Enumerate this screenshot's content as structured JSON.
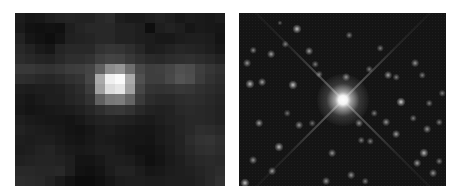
{
  "figure": {
    "panels": [
      {
        "id": "left",
        "description": "Low-resolution pixelated image of a single point source",
        "grid": {
          "cols": 21,
          "rows": 17,
          "values": [
            [
              28,
              22,
              24,
              30,
              34,
              36,
              34,
              34,
              40,
              44,
              30,
              26,
              26,
              30,
              34,
              30,
              24,
              28,
              26,
              24,
              28
            ],
            [
              26,
              18,
              16,
              18,
              16,
              30,
              36,
              40,
              40,
              40,
              34,
              34,
              30,
              14,
              30,
              34,
              30,
              22,
              26,
              24,
              22
            ],
            [
              34,
              22,
              18,
              14,
              20,
              32,
              34,
              36,
              40,
              40,
              34,
              34,
              30,
              28,
              24,
              24,
              28,
              30,
              30,
              28,
              20
            ],
            [
              40,
              34,
              26,
              22,
              36,
              40,
              40,
              40,
              50,
              54,
              52,
              46,
              38,
              28,
              30,
              34,
              38,
              36,
              34,
              30,
              24
            ],
            [
              44,
              40,
              36,
              34,
              40,
              46,
              46,
              50,
              62,
              68,
              66,
              56,
              48,
              42,
              40,
              44,
              46,
              48,
              44,
              40,
              34
            ],
            [
              56,
              56,
              52,
              50,
              54,
              60,
              62,
              68,
              96,
              140,
              150,
              110,
              72,
              62,
              64,
              70,
              80,
              76,
              62,
              54,
              48
            ],
            [
              46,
              44,
              40,
              38,
              42,
              48,
              52,
              70,
              170,
              240,
              250,
              170,
              80,
              62,
              62,
              72,
              84,
              78,
              60,
              50,
              44
            ],
            [
              30,
              28,
              30,
              30,
              32,
              38,
              44,
              60,
              160,
              220,
              230,
              160,
              70,
              52,
              50,
              52,
              56,
              54,
              48,
              44,
              40
            ],
            [
              26,
              22,
              26,
              30,
              30,
              36,
              40,
              50,
              96,
              120,
              124,
              100,
              58,
              44,
              40,
              40,
              44,
              46,
              44,
              40,
              36
            ],
            [
              24,
              20,
              22,
              24,
              26,
              28,
              32,
              38,
              46,
              54,
              56,
              50,
              40,
              34,
              32,
              34,
              40,
              42,
              40,
              38,
              34
            ],
            [
              30,
              26,
              24,
              22,
              22,
              20,
              24,
              30,
              34,
              36,
              34,
              32,
              28,
              26,
              30,
              34,
              36,
              40,
              40,
              38,
              34
            ],
            [
              34,
              30,
              28,
              26,
              24,
              20,
              18,
              22,
              28,
              30,
              26,
              24,
              22,
              22,
              26,
              30,
              36,
              40,
              46,
              44,
              40
            ],
            [
              30,
              28,
              30,
              30,
              26,
              22,
              20,
              24,
              28,
              26,
              24,
              22,
              22,
              20,
              26,
              30,
              34,
              44,
              50,
              52,
              46
            ],
            [
              28,
              30,
              34,
              36,
              30,
              26,
              24,
              26,
              30,
              30,
              26,
              22,
              18,
              18,
              22,
              28,
              34,
              40,
              46,
              48,
              44
            ],
            [
              32,
              34,
              36,
              36,
              34,
              30,
              20,
              20,
              24,
              30,
              30,
              28,
              22,
              16,
              20,
              26,
              30,
              36,
              40,
              42,
              40
            ],
            [
              40,
              40,
              38,
              38,
              40,
              30,
              18,
              16,
              20,
              28,
              34,
              34,
              28,
              22,
              24,
              28,
              30,
              32,
              36,
              40,
              44
            ],
            [
              44,
              42,
              40,
              34,
              26,
              18,
              12,
              12,
              16,
              22,
              28,
              30,
              30,
              28,
              28,
              30,
              30,
              30,
              34,
              40,
              48
            ]
          ]
        }
      },
      {
        "id": "right",
        "description": "High-resolution star field with a bright central star showing diffraction spikes",
        "central_star": {
          "x": 104,
          "y": 87,
          "core_radius": 6,
          "halo_radius": 26
        },
        "spikes": [
          {
            "angle": -45,
            "length": 150
          },
          {
            "angle": 135,
            "length": 150
          },
          {
            "angle": 45,
            "length": 150
          },
          {
            "angle": -135,
            "length": 150
          }
        ],
        "stars": [
          {
            "x": 58,
            "y": 16,
            "r": 3.5,
            "b": 0.75
          },
          {
            "x": 46,
            "y": 31,
            "r": 2.5,
            "b": 0.45
          },
          {
            "x": 14,
            "y": 37,
            "r": 2.5,
            "b": 0.5
          },
          {
            "x": 32,
            "y": 41,
            "r": 3,
            "b": 0.6
          },
          {
            "x": 70,
            "y": 38,
            "r": 3,
            "b": 0.6
          },
          {
            "x": 8,
            "y": 50,
            "r": 3,
            "b": 0.55
          },
          {
            "x": 11,
            "y": 71,
            "r": 3.5,
            "b": 0.7
          },
          {
            "x": 23,
            "y": 69,
            "r": 3,
            "b": 0.6
          },
          {
            "x": 54,
            "y": 72,
            "r": 3.5,
            "b": 0.75
          },
          {
            "x": 76,
            "y": 51,
            "r": 2.5,
            "b": 0.45
          },
          {
            "x": 41,
            "y": 10,
            "r": 2,
            "b": 0.35
          },
          {
            "x": 80,
            "y": 61,
            "r": 2.5,
            "b": 0.45
          },
          {
            "x": 141,
            "y": 35,
            "r": 2.5,
            "b": 0.45
          },
          {
            "x": 110,
            "y": 22,
            "r": 2.5,
            "b": 0.45
          },
          {
            "x": 107,
            "y": 64,
            "r": 3,
            "b": 0.55
          },
          {
            "x": 149,
            "y": 62,
            "r": 3,
            "b": 0.6
          },
          {
            "x": 130,
            "y": 56,
            "r": 2.5,
            "b": 0.45
          },
          {
            "x": 157,
            "y": 64,
            "r": 2.5,
            "b": 0.45
          },
          {
            "x": 176,
            "y": 50,
            "r": 3,
            "b": 0.55
          },
          {
            "x": 162,
            "y": 89,
            "r": 3.5,
            "b": 0.8
          },
          {
            "x": 183,
            "y": 62,
            "r": 2.5,
            "b": 0.45
          },
          {
            "x": 203,
            "y": 80,
            "r": 2.5,
            "b": 0.45
          },
          {
            "x": 190,
            "y": 90,
            "r": 2.5,
            "b": 0.45
          },
          {
            "x": 120,
            "y": 110,
            "r": 3,
            "b": 0.55
          },
          {
            "x": 135,
            "y": 100,
            "r": 2.5,
            "b": 0.45
          },
          {
            "x": 147,
            "y": 109,
            "r": 3,
            "b": 0.55
          },
          {
            "x": 157,
            "y": 121,
            "r": 3,
            "b": 0.6
          },
          {
            "x": 174,
            "y": 105,
            "r": 2.5,
            "b": 0.45
          },
          {
            "x": 200,
            "y": 109,
            "r": 2.5,
            "b": 0.45
          },
          {
            "x": 188,
            "y": 116,
            "r": 3,
            "b": 0.55
          },
          {
            "x": 122,
            "y": 127,
            "r": 2.5,
            "b": 0.45
          },
          {
            "x": 131,
            "y": 128,
            "r": 2.5,
            "b": 0.45
          },
          {
            "x": 185,
            "y": 140,
            "r": 3.5,
            "b": 0.7
          },
          {
            "x": 178,
            "y": 150,
            "r": 3,
            "b": 0.6
          },
          {
            "x": 200,
            "y": 148,
            "r": 2.5,
            "b": 0.45
          },
          {
            "x": 194,
            "y": 160,
            "r": 3,
            "b": 0.55
          },
          {
            "x": 112,
            "y": 162,
            "r": 3,
            "b": 0.55
          },
          {
            "x": 126,
            "y": 168,
            "r": 2.5,
            "b": 0.45
          },
          {
            "x": 93,
            "y": 140,
            "r": 3,
            "b": 0.55
          },
          {
            "x": 60,
            "y": 112,
            "r": 3,
            "b": 0.55
          },
          {
            "x": 40,
            "y": 134,
            "r": 3.5,
            "b": 0.7
          },
          {
            "x": 20,
            "y": 110,
            "r": 3,
            "b": 0.6
          },
          {
            "x": 14,
            "y": 147,
            "r": 3,
            "b": 0.55
          },
          {
            "x": 33,
            "y": 158,
            "r": 3,
            "b": 0.55
          },
          {
            "x": 6,
            "y": 170,
            "r": 3.5,
            "b": 0.75
          },
          {
            "x": 87,
            "y": 168,
            "r": 3,
            "b": 0.55
          },
          {
            "x": 73,
            "y": 110,
            "r": 2.5,
            "b": 0.4
          },
          {
            "x": 48,
            "y": 100,
            "r": 2.5,
            "b": 0.4
          }
        ]
      }
    ]
  }
}
